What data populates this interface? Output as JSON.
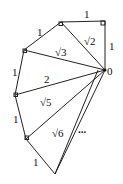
{
  "diagram": {
    "origin_label": "0",
    "unit_labels": [
      "1",
      "1",
      "1",
      "1",
      "1",
      "1"
    ],
    "hypotenuse_labels": [
      "√2",
      "√3",
      "2",
      "√5",
      "√6"
    ],
    "continuation": "..."
  }
}
